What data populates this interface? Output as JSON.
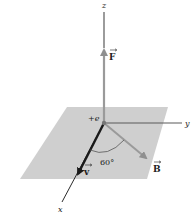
{
  "diagram": {
    "type": "3d-vector-diagram",
    "axes": {
      "x": {
        "label": "x"
      },
      "y": {
        "label": "y"
      },
      "z": {
        "label": "z"
      }
    },
    "origin": {
      "label": "+e"
    },
    "vectors": [
      {
        "name": "F",
        "label": "F",
        "direction": "+z",
        "color": "#9a9a9a"
      },
      {
        "name": "v",
        "label": "v",
        "direction": "+x",
        "color": "#1a1a1a"
      },
      {
        "name": "B",
        "label": "B",
        "direction": "in xy-plane, 60° from v",
        "color": "#9a9a9a"
      }
    ],
    "angle": {
      "label": "60°",
      "between": [
        "v",
        "B"
      ]
    },
    "plane": {
      "name": "xy-plane",
      "color": "#cfcfcf"
    }
  }
}
